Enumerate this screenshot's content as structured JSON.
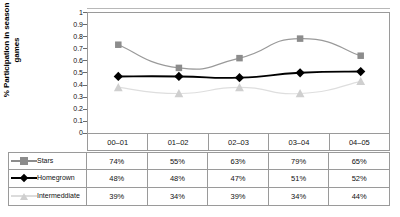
{
  "chart_data": {
    "type": "line",
    "title": "",
    "xlabel": "",
    "ylabel": "% Participation in season games",
    "ylabel_lines": [
      "% Participation in season",
      "games"
    ],
    "categories": [
      "00–01",
      "01–02",
      "02–03",
      "03–04",
      "04–05"
    ],
    "ylim": [
      0,
      1
    ],
    "yticks": [
      "1",
      "0.9",
      "0.8",
      "0.7",
      "0.6",
      "0.5",
      "0.4",
      "0.3",
      "0.2",
      "0.1",
      "0"
    ],
    "ytick_values": [
      1,
      0.9,
      0.8,
      0.7,
      0.6,
      0.5,
      0.4,
      0.3,
      0.2,
      0.1,
      0
    ],
    "grid": false,
    "legend_position": "data-table-left",
    "smooth_lines": true,
    "series": [
      {
        "name": "Stars",
        "marker": "square",
        "color": "#8c8c8c",
        "values": [
          0.74,
          0.55,
          0.63,
          0.79,
          0.65
        ],
        "labels": [
          "74%",
          "55%",
          "63%",
          "79%",
          "65%"
        ]
      },
      {
        "name": "Homegrown",
        "marker": "diamond",
        "color": "#000000",
        "values": [
          0.48,
          0.48,
          0.47,
          0.51,
          0.52
        ],
        "labels": [
          "48%",
          "48%",
          "47%",
          "51%",
          "52%"
        ]
      },
      {
        "name": "Intermeddiate",
        "marker": "triangle",
        "color": "#cfcfcf",
        "values": [
          0.39,
          0.34,
          0.39,
          0.34,
          0.44
        ],
        "labels": [
          "39%",
          "34%",
          "39%",
          "34%",
          "44%"
        ]
      }
    ]
  },
  "colors": {
    "stars": "#8c8c8c",
    "homegrown": "#000000",
    "intermediate": "#cfcfcf",
    "axis": "#9a9a9a",
    "text": "#111111",
    "background": "#ffffff"
  }
}
